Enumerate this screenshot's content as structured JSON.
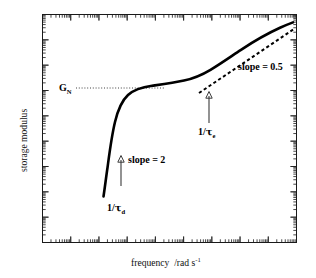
{
  "figure": {
    "name": "storage-modulus-frequency-plot",
    "xlabel_main": "frequency",
    "xlabel_units": "/rad s",
    "xlabel_units_exp": "-1",
    "ylabel": "storage modulus",
    "background_color": "#ffffff",
    "line_color": "#000000",
    "frame_color": "#1a1a1a"
  },
  "annotations": {
    "plateau_label": "G",
    "plateau_label_sub": "N",
    "slope_low_label": "slope = 2",
    "slope_high_label": "slope = 0.5",
    "tau_d_label_pre": "1/",
    "tau_d_label_tau": "τ",
    "tau_d_label_sub": "d",
    "tau_e_label_pre": "1/",
    "tau_e_label_tau": "τ",
    "tau_e_label_sub": "e",
    "arrow_up_glyph": "∆"
  },
  "chart_data": {
    "type": "line",
    "title": "",
    "xlabel": "frequency /rad s-1",
    "ylabel": "storage modulus",
    "xscale": "log",
    "yscale": "log",
    "grid": false,
    "legend": false,
    "axis_ticks": "minor log decade ticks on all four sides, no numeric tick labels",
    "x_decades": 9,
    "y_decades": 9,
    "series": [
      {
        "name": "storage modulus G'",
        "style": "solid",
        "description": "sigmoidal: terminal slope-2 rise from 1/tau_d, rubbery plateau at G_N, then slope-0.5 Rouse rise beyond 1/tau_e",
        "x": [
          0.0,
          0.02,
          0.05,
          0.08,
          0.12,
          0.17,
          0.22,
          0.28,
          0.34,
          0.42,
          0.5,
          0.58,
          0.66,
          0.74,
          0.82,
          0.9,
          1.0
        ],
        "y": [
          0.0,
          0.1,
          0.23,
          0.35,
          0.46,
          0.53,
          0.565,
          0.59,
          0.615,
          0.645,
          0.675,
          0.715,
          0.755,
          0.8,
          0.85,
          0.91,
          0.975
        ]
      },
      {
        "name": "slope 0.5 tangent",
        "style": "dashed",
        "description": "dashed straight reference line of slope 0.5 drawn along the high-frequency branch",
        "x": [
          0.62,
          1.0
        ],
        "y": [
          0.655,
          0.955
        ]
      },
      {
        "name": "G_N plateau guide",
        "style": "dotted",
        "description": "horizontal dotted line marking the plateau modulus G_N",
        "y_value": 0.665
      }
    ],
    "markers": [
      {
        "label": "1/tau_d",
        "note": "low-frequency end of the slope-2 region"
      },
      {
        "label": "1/tau_e",
        "note": "crossover to the slope-0.5 Rouse region"
      },
      {
        "label": "G_N",
        "note": "plateau modulus level"
      }
    ]
  }
}
